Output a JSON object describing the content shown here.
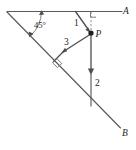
{
  "figure": {
    "background_color": "#ffffff",
    "line_color": "#59595c",
    "vector_color": "#4d4d50",
    "label_color": "#1e1e20",
    "width": 136,
    "height": 150
  },
  "labels": {
    "angle": "45°",
    "point": "P",
    "ray_top_end": "A",
    "ray_bottom_end": "B",
    "vector_one": "1",
    "vector_two": "2",
    "vector_three": "3"
  },
  "geometry": {
    "apex": {
      "x": 7,
      "y": 12
    },
    "point_p": {
      "x": 91,
      "y": 33
    },
    "top_line": {
      "x1": 7,
      "y1": 11,
      "x2": 122,
      "y2": 11
    },
    "incline_line": {
      "x1": 7,
      "y1": 12,
      "x2": 120,
      "y2": 128
    },
    "angle_degrees": 45,
    "right_angle_markers": [
      {
        "name": "top-right-angle",
        "x": 93,
        "y": 13
      },
      {
        "name": "incline-right-angle",
        "x": 60,
        "y": 67
      }
    ]
  },
  "vectors": [
    {
      "name": "vector-1",
      "label": "1",
      "from": {
        "x": 76,
        "y": 11
      },
      "to": {
        "x": 90,
        "y": 32
      },
      "label_pos": {
        "x": 77,
        "y": 25
      },
      "direction": "down-right toward P"
    },
    {
      "name": "vector-3",
      "label": "3",
      "from": {
        "x": 90,
        "y": 34
      },
      "to": {
        "x": 62,
        "y": 53
      },
      "label_pos": {
        "x": 66,
        "y": 44
      },
      "direction": "down-left, perpendicular to incline"
    },
    {
      "name": "vector-2",
      "label": "2",
      "from": {
        "x": 91,
        "y": 35
      },
      "to": {
        "x": 91,
        "y": 74
      },
      "label_pos": {
        "x": 96,
        "y": 83
      },
      "direction": "straight down"
    }
  ],
  "annotations": {
    "dashed_guide": {
      "name": "vertical-dashed-guide",
      "from": {
        "x": 91,
        "y": 12
      },
      "to": {
        "x": 91,
        "y": 30
      }
    },
    "perpendicular_foot": {
      "name": "perpendicular-to-incline",
      "from": {
        "x": 62,
        "y": 53
      },
      "to": {
        "x": 54,
        "y": 61
      }
    },
    "vertical_extension": {
      "name": "vertical-line-extension",
      "from": {
        "x": 91,
        "y": 74
      },
      "to": {
        "x": 91,
        "y": 106
      }
    }
  }
}
